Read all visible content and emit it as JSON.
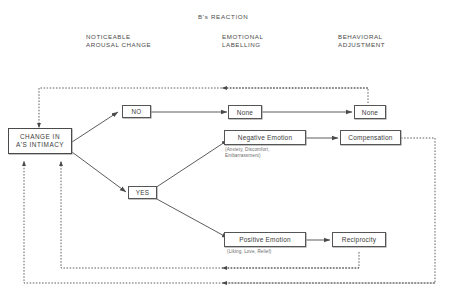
{
  "diagram": {
    "title": "B's REACTION",
    "columns": [
      {
        "id": "arousal",
        "label": "NOTICEABLE\nAROUSAL CHANGE"
      },
      {
        "id": "labelling",
        "label": "EMOTIONAL\nLABELLING"
      },
      {
        "id": "behavioral",
        "label": "BEHAVIORAL\nADJUSTMENT"
      }
    ],
    "nodes": {
      "stimulus": {
        "label": "CHANGE IN\nA'S INTIMACY"
      },
      "no": {
        "label": "NO"
      },
      "yes": {
        "label": "YES"
      },
      "none_emotion": {
        "label": "None"
      },
      "none_behavior": {
        "label": "None"
      },
      "negative_emotion": {
        "label": "Negative Emotion"
      },
      "negative_emotion_examples": {
        "label": "(Anxiety, Discomfort,\nEmbarrassment)"
      },
      "positive_emotion": {
        "label": "Positive Emotion"
      },
      "positive_emotion_examples": {
        "label": "(Liking, Love, Relief)"
      },
      "compensation": {
        "label": "Compensation"
      },
      "reciprocity": {
        "label": "Reciprocity"
      }
    },
    "colors": {
      "line": "#4a4a4a",
      "text": "#3b3b3b",
      "header_text": "#4a4a4a",
      "sublabel_text": "#6b6b6b",
      "background": "#ffffff",
      "box_border": "#555555",
      "box_shadow": "#9a9a9a"
    }
  }
}
